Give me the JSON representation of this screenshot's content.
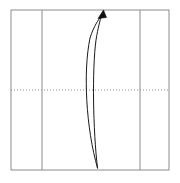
{
  "canvas": {
    "width": 180,
    "height": 183,
    "background": "#ffffff"
  },
  "diagram": {
    "type": "trajectory-loop-diagram",
    "title": "",
    "frame": {
      "label": "grid-frame",
      "x": 11,
      "y": 10,
      "width": 158,
      "height": 160,
      "stroke": "#8c8c8c",
      "stroke_width": 1,
      "fill": "none"
    },
    "grid": {
      "stroke": "#8c8c8c",
      "stroke_width": 1,
      "vertical_lines": [
        {
          "label": "vertical-gridline-1",
          "x": 42,
          "y1": 10,
          "y2": 170,
          "style": "solid"
        },
        {
          "label": "vertical-gridline-2",
          "x": 140,
          "y1": 10,
          "y2": 170,
          "style": "solid"
        }
      ],
      "horizontal_lines": [
        {
          "label": "horizontal-gridline-axis",
          "y": 90,
          "x1": 11,
          "x2": 169,
          "style": "dotted",
          "dash": "1,2"
        }
      ]
    },
    "curve": {
      "label": "loop-path",
      "stroke": "#1a1a1a",
      "stroke_width": 1,
      "fill": "none",
      "description": "narrow elongated lens loop rising from lower tip to upper tip",
      "left_stroke_path": "M 97.5 168 C 86 128, 83 72, 90 38 C 94 26, 98 20, 101.5 16",
      "right_stroke_path": "M 97.5 168 C 93 130, 92 70, 96 40 C 98 28, 100 20, 101.5 16",
      "lower_tip": {
        "x": 97.5,
        "y": 168
      },
      "upper_tip": {
        "x": 101.5,
        "y": 16
      },
      "widest_point": {
        "x": 86,
        "y": 96
      }
    },
    "arrow": {
      "label": "arrowhead",
      "fill": "#111111",
      "direction": "up",
      "tip": {
        "x": 103.5,
        "y": 10
      },
      "points": "103.5,10 98.0,18.5 106.5,17.5"
    }
  }
}
